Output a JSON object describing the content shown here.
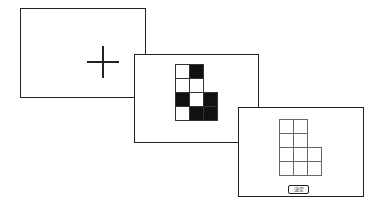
{
  "diagram": {
    "title": "",
    "panels": [
      {
        "id": "fixation",
        "content": "fixation-cross"
      },
      {
        "id": "stimulus",
        "content": "grid-pattern",
        "grid": {
          "columns": 3,
          "rows": 4,
          "cells": [
            {
              "row": 0,
              "col": 0,
              "fill": "white"
            },
            {
              "row": 0,
              "col": 1,
              "fill": "black"
            },
            {
              "row": 1,
              "col": 0,
              "fill": "white"
            },
            {
              "row": 1,
              "col": 1,
              "fill": "white"
            },
            {
              "row": 2,
              "col": 0,
              "fill": "black"
            },
            {
              "row": 2,
              "col": 1,
              "fill": "white"
            },
            {
              "row": 2,
              "col": 2,
              "fill": "black"
            },
            {
              "row": 3,
              "col": 0,
              "fill": "white"
            },
            {
              "row": 3,
              "col": 1,
              "fill": "black"
            },
            {
              "row": 3,
              "col": 2,
              "fill": "black"
            }
          ]
        }
      },
      {
        "id": "response",
        "content": "empty-grid",
        "grid": {
          "columns": 3,
          "rows": 4,
          "cells": [
            {
              "row": 0,
              "col": 0
            },
            {
              "row": 0,
              "col": 1
            },
            {
              "row": 1,
              "col": 0
            },
            {
              "row": 1,
              "col": 1
            },
            {
              "row": 2,
              "col": 0
            },
            {
              "row": 2,
              "col": 1
            },
            {
              "row": 2,
              "col": 2
            },
            {
              "row": 3,
              "col": 0
            },
            {
              "row": 3,
              "col": 1
            },
            {
              "row": 3,
              "col": 2
            }
          ]
        },
        "button_label": "決定"
      }
    ],
    "colors": {
      "border": "#222222",
      "filled": "#111111",
      "background": "#ffffff"
    }
  }
}
